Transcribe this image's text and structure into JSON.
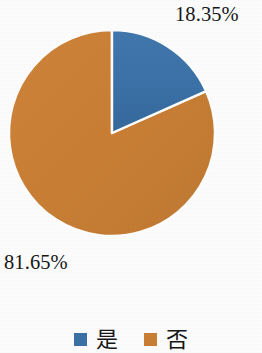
{
  "chart_data": {
    "type": "pie",
    "title": "",
    "subtitle": "",
    "xlabel": "",
    "ylabel": "",
    "grid": false,
    "legend_position": "bottom",
    "start_angle_deg": 0,
    "direction": "clockwise",
    "categories": [
      "是",
      "否"
    ],
    "values": [
      18.35,
      81.65
    ],
    "value_unit": "%",
    "slices": [
      {
        "label": "是",
        "value": 18.35,
        "value_text": "18.35%",
        "color": "#3c72a8",
        "start_deg": 0,
        "end_deg": 66.06
      },
      {
        "label": "否",
        "value": 81.65,
        "value_text": "81.65%",
        "color": "#ca7f35",
        "start_deg": 66.06,
        "end_deg": 360
      }
    ],
    "data_labels": [
      "18.35%",
      "81.65%"
    ],
    "legend": [
      {
        "label": "是",
        "color": "#3c72a8"
      },
      {
        "label": "否",
        "color": "#ca7f35"
      }
    ]
  },
  "labels": {
    "yes_percent": "18.35%",
    "no_percent": "81.65%"
  },
  "legend": {
    "items": [
      {
        "label": "是",
        "color": "#3c72a8"
      },
      {
        "label": "否",
        "color": "#ca7f35"
      }
    ]
  },
  "colors": {
    "series_blue": "#3c72a8",
    "series_orange": "#ca7f35",
    "background": "#fefefe",
    "text": "#181818",
    "slice_divider": "#ffffff"
  },
  "geometry": {
    "center_x": 112,
    "center_y": 133,
    "radius": 103
  }
}
